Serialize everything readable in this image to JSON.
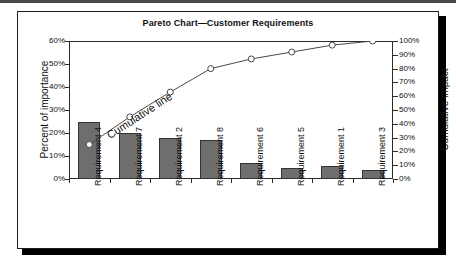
{
  "figure": {
    "title": "Pareto Chart—Customer Requirements"
  },
  "chart_data": {
    "type": "bar",
    "title": "Pareto Chart—Customer Requirements",
    "xlabel": "",
    "ylabel": "Percent of importance",
    "y2label": "Cumulative impact",
    "grid": false,
    "legend": "none",
    "annotation": "Cumulative line",
    "categories": [
      "Requirement 4",
      "Requirement 7",
      "Requirement 2",
      "Requirement 8",
      "Requirement 6",
      "Requirement 5",
      "Requirement 1",
      "Requirement 3"
    ],
    "series": [
      {
        "name": "Percent of importance",
        "type": "bar",
        "axis": "left",
        "values": [
          25,
          20,
          18,
          17,
          7,
          5,
          5.5,
          4
        ]
      },
      {
        "name": "Cumulative line",
        "type": "line",
        "axis": "right",
        "values": [
          25,
          45,
          63,
          80,
          87,
          92,
          97,
          100
        ]
      }
    ],
    "ylim": [
      0,
      60
    ],
    "y2lim": [
      0,
      100
    ],
    "yticks": [
      "0%",
      "10%",
      "20%",
      "30%",
      "40%",
      "50%",
      "60%"
    ],
    "y2ticks": [
      "0%",
      "10%",
      "20%",
      "30%",
      "40%",
      "50%",
      "60%",
      "70%",
      "80%",
      "90%",
      "100%"
    ],
    "colors": {
      "bar_fill": "#6e6e6e",
      "bar_edge": "#333333",
      "line": "#4a4a4a",
      "marker_fill": "#ffffff",
      "axis": "#2b2b2b"
    }
  }
}
